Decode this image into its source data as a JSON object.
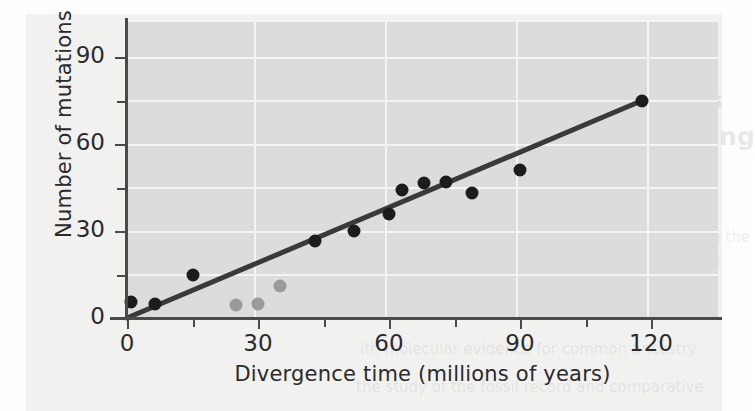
{
  "figure": {
    "background_color": "#f1f1f0",
    "panel_color": "#dcdcdc",
    "grid_color": "#f4f4f4",
    "axis_color": "#4a4a4a"
  },
  "bleed_text": {
    "line1": "HAPTER 21",
    "line2": "information converges",
    "line3": "e levels of understanding",
    "line4": "evolutionary history",
    "line5": "discovery that the DNA, RNA, and protein",
    "line6": "re dramatic lines of evidence came to light in the",
    "line7": "he mechanism of inheritance, the storage and",
    "line8": "evolutionary relationships among organisms",
    "line9": "ith molecular evidence for common ancestry",
    "line10": "the study of the fossil record and comparative"
  },
  "chart_data": {
    "type": "scatter",
    "title": "",
    "xlabel": "Divergence time (millions of years)",
    "ylabel": "Number of mutations",
    "xlim": [
      0,
      135
    ],
    "ylim": [
      0,
      102
    ],
    "xticks": [
      0,
      30,
      60,
      90,
      120
    ],
    "xticks_minor": [
      15,
      45,
      75,
      105
    ],
    "yticks": [
      0,
      30,
      60,
      90
    ],
    "yticks_minor": [
      15,
      45,
      75
    ],
    "grid": true,
    "legend": "none",
    "series": [
      {
        "name": "primary-data-points",
        "color": "#1c1c1c",
        "marker": "circle",
        "marker_size": 13,
        "points": [
          {
            "x": 1,
            "y": 5.5
          },
          {
            "x": 6.5,
            "y": 5
          },
          {
            "x": 15,
            "y": 15
          },
          {
            "x": 43,
            "y": 26.5
          },
          {
            "x": 52,
            "y": 30
          },
          {
            "x": 60,
            "y": 36
          },
          {
            "x": 63,
            "y": 44
          },
          {
            "x": 68,
            "y": 46.5
          },
          {
            "x": 73,
            "y": 47
          },
          {
            "x": 79,
            "y": 43
          },
          {
            "x": 90,
            "y": 51
          },
          {
            "x": 118,
            "y": 75
          }
        ]
      },
      {
        "name": "outlier-data-points",
        "color": "#9a9a9a",
        "marker": "circle",
        "marker_size": 13,
        "points": [
          {
            "x": 25,
            "y": 4.5
          },
          {
            "x": 30,
            "y": 5
          },
          {
            "x": 35,
            "y": 11
          }
        ]
      }
    ],
    "trendline": {
      "name": "regression-line",
      "color": "#3a3a3a",
      "width": 5,
      "x0": 0,
      "y0": 0,
      "x1": 118,
      "y1": 75
    }
  }
}
